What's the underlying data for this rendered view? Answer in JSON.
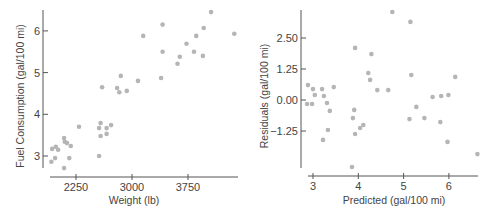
{
  "chart_data": [
    {
      "type": "scatter",
      "title": "",
      "xlabel": "Weight (lb)",
      "ylabel": "Fuel Consumption (gal/100 mi)",
      "xticks": [
        "2250",
        "3000",
        "3750"
      ],
      "yticks": [
        "3",
        "4",
        "5",
        "6"
      ],
      "xlim": [
        1900,
        4320
      ],
      "ylim": [
        2.5,
        6.6
      ],
      "grid": false,
      "point_color": "#b5b5b5",
      "points": [
        [
          1920,
          2.86
        ],
        [
          1930,
          3.17
        ],
        [
          1970,
          2.95
        ],
        [
          1980,
          3.22
        ],
        [
          2010,
          3.15
        ],
        [
          2090,
          2.71
        ],
        [
          2090,
          3.43
        ],
        [
          2100,
          3.34
        ],
        [
          2130,
          3.31
        ],
        [
          2160,
          2.95
        ],
        [
          2180,
          3.24
        ],
        [
          2290,
          3.7
        ],
        [
          2560,
          3.67
        ],
        [
          2560,
          3.0
        ],
        [
          2580,
          3.79
        ],
        [
          2580,
          3.48
        ],
        [
          2600,
          4.65
        ],
        [
          2660,
          3.67
        ],
        [
          2660,
          3.53
        ],
        [
          2720,
          3.74
        ],
        [
          2800,
          4.63
        ],
        [
          2830,
          4.53
        ],
        [
          2850,
          4.92
        ],
        [
          2930,
          4.56
        ],
        [
          3080,
          4.8
        ],
        [
          3150,
          5.88
        ],
        [
          3390,
          4.87
        ],
        [
          3410,
          5.5
        ],
        [
          3410,
          6.15
        ],
        [
          3610,
          5.21
        ],
        [
          3640,
          5.38
        ],
        [
          3730,
          5.69
        ],
        [
          3830,
          5.5
        ],
        [
          3860,
          5.88
        ],
        [
          3950,
          5.4
        ],
        [
          3960,
          6.07
        ],
        [
          4060,
          6.45
        ],
        [
          4370,
          5.93
        ]
      ]
    },
    {
      "type": "scatter",
      "title": "",
      "xlabel": "Predicted (gal/100 mi)",
      "ylabel": "Residuals (gal/100 mi)",
      "xticks": [
        "3",
        "4",
        "5",
        "6"
      ],
      "yticks": [
        "2.50",
        "1.25",
        "0.00",
        "−1.25"
      ],
      "xlim": [
        2.85,
        6.65
      ],
      "ylim": [
        -2.2,
        2.95
      ],
      "grid": false,
      "point_color": "#b5b5b5",
      "points": [
        [
          2.87,
          -0.16
        ],
        [
          2.89,
          0.6
        ],
        [
          2.98,
          -0.16
        ],
        [
          3.0,
          0.44
        ],
        [
          3.04,
          0.2
        ],
        [
          3.2,
          0.44
        ],
        [
          3.22,
          -1.61
        ],
        [
          3.24,
          0.16
        ],
        [
          3.31,
          -0.12
        ],
        [
          3.33,
          -1.21
        ],
        [
          3.37,
          -0.44
        ],
        [
          3.46,
          0.52
        ],
        [
          3.86,
          -2.7
        ],
        [
          3.88,
          -0.73
        ],
        [
          3.91,
          -0.4
        ],
        [
          3.93,
          -1.37
        ],
        [
          3.93,
          2.1
        ],
        [
          4.04,
          -1.13
        ],
        [
          4.11,
          -1.01
        ],
        [
          4.22,
          1.09
        ],
        [
          4.26,
          0.81
        ],
        [
          4.29,
          1.85
        ],
        [
          4.42,
          0.4
        ],
        [
          4.66,
          0.4
        ],
        [
          4.75,
          3.55
        ],
        [
          5.13,
          -0.77
        ],
        [
          5.15,
          3.15
        ],
        [
          5.17,
          1.01
        ],
        [
          5.28,
          -0.28
        ],
        [
          5.46,
          -0.73
        ],
        [
          5.64,
          0.12
        ],
        [
          5.81,
          -0.89
        ],
        [
          5.83,
          0.16
        ],
        [
          5.97,
          -1.69
        ],
        [
          5.99,
          0.2
        ],
        [
          6.14,
          0.93
        ],
        [
          6.63,
          -2.18
        ]
      ]
    }
  ]
}
